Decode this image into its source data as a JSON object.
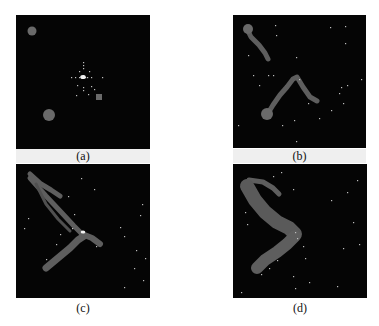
{
  "figure": {
    "panels": [
      {
        "id": "a",
        "caption": "(a)",
        "box": {
          "x": 16,
          "y": 15,
          "size": 134
        },
        "caption_y": 149,
        "band": true,
        "shapes": [
          {
            "type": "circle",
            "cx": 16,
            "cy": 16,
            "r": 4.5,
            "fill": "#6a6a6a"
          },
          {
            "type": "circle",
            "cx": 33,
            "cy": 100,
            "r": 6,
            "fill": "#6a6a6a"
          },
          {
            "type": "rect",
            "x": 80,
            "y": 79,
            "w": 6,
            "h": 6,
            "fill": "#6a6a6a"
          }
        ],
        "dots": [
          [
            67,
            62
          ],
          [
            67,
            60
          ],
          [
            65,
            62
          ],
          [
            69,
            62
          ],
          [
            63,
            62
          ],
          [
            71,
            62
          ],
          [
            59,
            62
          ],
          [
            55,
            62
          ],
          [
            75,
            62
          ],
          [
            86,
            62
          ],
          [
            67,
            53
          ],
          [
            67,
            50
          ],
          [
            67,
            47
          ],
          [
            67,
            72
          ],
          [
            67,
            75
          ],
          [
            73,
            56
          ],
          [
            75,
            71
          ],
          [
            72,
            79
          ],
          [
            63,
            56
          ],
          [
            61,
            70
          ],
          [
            60,
            80
          ],
          [
            78,
            74
          ]
        ],
        "center_dot": {
          "cx": 67,
          "cy": 62,
          "r": 2
        }
      },
      {
        "id": "b",
        "caption": "(b)",
        "box": {
          "x": 233,
          "y": 15,
          "size": 133
        },
        "caption_y": 149,
        "band": true,
        "strokes": [
          {
            "points": [
              [
                14,
                14
              ],
              [
                18,
                22
              ],
              [
                26,
                30
              ],
              [
                32,
                38
              ],
              [
                35,
                44
              ]
            ],
            "width": 5,
            "color": "#5e5e5e"
          },
          {
            "points": [
              [
                34,
                100
              ],
              [
                40,
                90
              ],
              [
                47,
                80
              ],
              [
                54,
                72
              ],
              [
                60,
                64
              ],
              [
                64,
                62
              ],
              [
                70,
                72
              ],
              [
                77,
                82
              ],
              [
                84,
                86
              ]
            ],
            "width": 5,
            "color": "#5e5e5e"
          }
        ],
        "shapes": [
          {
            "type": "circle",
            "cx": 15,
            "cy": 14,
            "r": 5,
            "fill": "#6a6a6a"
          },
          {
            "type": "circle",
            "cx": 34,
            "cy": 99,
            "r": 6,
            "fill": "#6a6a6a"
          }
        ],
        "dots": [
          [
            42,
            10
          ],
          [
            43,
            20
          ],
          [
            63,
            42
          ],
          [
            97,
            12
          ],
          [
            112,
            11
          ],
          [
            112,
            28
          ],
          [
            128,
            64
          ],
          [
            35,
            60
          ],
          [
            20,
            60
          ],
          [
            15,
            40
          ],
          [
            26,
            70
          ],
          [
            61,
            105
          ],
          [
            75,
            88
          ],
          [
            98,
            95
          ],
          [
            110,
            88
          ],
          [
            108,
            72
          ],
          [
            114,
            70
          ],
          [
            86,
            103
          ],
          [
            40,
            60
          ],
          [
            5,
            110
          ],
          [
            63,
            126
          ],
          [
            49,
            110
          ],
          [
            106,
            78
          ],
          [
            66,
            64
          ]
        ]
      },
      {
        "id": "c",
        "caption": "(c)",
        "box": {
          "x": 16,
          "y": 164,
          "size": 134
        },
        "caption_y": 300,
        "band": false,
        "strokes": [
          {
            "points": [
              [
                14,
                10
              ],
              [
                25,
                20
              ],
              [
                35,
                26
              ],
              [
                44,
                32
              ]
            ],
            "width": 5,
            "color": "#5e5e5e"
          },
          {
            "points": [
              [
                14,
                14
              ],
              [
                30,
                32
              ],
              [
                45,
                48
              ],
              [
                58,
                62
              ],
              [
                66,
                70
              ]
            ],
            "width": 5,
            "color": "#5e5e5e"
          },
          {
            "points": [
              [
                20,
                20
              ],
              [
                30,
                40
              ],
              [
                42,
                55
              ],
              [
                54,
                67
              ]
            ],
            "width": 3,
            "color": "#505050"
          },
          {
            "points": [
              [
                66,
                70
              ],
              [
                76,
                74
              ],
              [
                84,
                80
              ]
            ],
            "width": 6,
            "color": "#5e5e5e"
          },
          {
            "points": [
              [
                30,
                104
              ],
              [
                42,
                94
              ],
              [
                54,
                84
              ],
              [
                62,
                76
              ],
              [
                68,
                72
              ]
            ],
            "width": 7,
            "color": "#5e5e5e"
          }
        ],
        "shapes": [],
        "dots": [
          [
            65,
            14
          ],
          [
            78,
            25
          ],
          [
            52,
            32
          ],
          [
            58,
            50
          ],
          [
            12,
            54
          ],
          [
            8,
            64
          ],
          [
            126,
            40
          ],
          [
            124,
            51
          ],
          [
            104,
            63
          ],
          [
            108,
            72
          ],
          [
            120,
            86
          ],
          [
            129,
            94
          ],
          [
            118,
            104
          ],
          [
            127,
            116
          ],
          [
            108,
            123
          ],
          [
            92,
            136
          ],
          [
            32,
            134
          ],
          [
            80,
            82
          ],
          [
            67,
            68
          ],
          [
            56,
            64
          ],
          [
            44,
            70
          ],
          [
            40,
            80
          ],
          [
            30,
            95
          ]
        ],
        "center_dot": {
          "cx": 67,
          "cy": 68,
          "r": 1.5
        }
      },
      {
        "id": "d",
        "caption": "(d)",
        "box": {
          "x": 233,
          "y": 164,
          "size": 134
        },
        "caption_y": 300,
        "band": false,
        "strokes": [
          {
            "points": [
              [
                16,
                16
              ],
              [
                30,
                18
              ],
              [
                40,
                24
              ],
              [
                46,
                30
              ]
            ],
            "width": 5,
            "color": "#5e5e5e"
          },
          {
            "points": [
              [
                14,
                22
              ],
              [
                22,
                36
              ],
              [
                32,
                48
              ],
              [
                44,
                58
              ],
              [
                56,
                64
              ],
              [
                62,
                70
              ]
            ],
            "width": 14,
            "color": "#5a5a5a"
          },
          {
            "points": [
              [
                62,
                72
              ],
              [
                54,
                80
              ],
              [
                44,
                88
              ],
              [
                32,
                96
              ],
              [
                24,
                104
              ]
            ],
            "width": 12,
            "color": "#5e5e5e"
          }
        ],
        "shapes": [],
        "dots": [
          [
            40,
            12
          ],
          [
            48,
            8
          ],
          [
            60,
            25
          ],
          [
            98,
            36
          ],
          [
            114,
            28
          ],
          [
            124,
            16
          ],
          [
            12,
            48
          ],
          [
            14,
            60
          ],
          [
            120,
            58
          ],
          [
            126,
            80
          ],
          [
            110,
            84
          ],
          [
            62,
            68
          ],
          [
            64,
            74
          ],
          [
            70,
            82
          ],
          [
            72,
            94
          ],
          [
            60,
            112
          ],
          [
            76,
            118
          ],
          [
            62,
            124
          ],
          [
            104,
            122
          ],
          [
            8,
            128
          ],
          [
            28,
            110
          ],
          [
            36,
            104
          ],
          [
            44,
            96
          ]
        ]
      }
    ]
  }
}
